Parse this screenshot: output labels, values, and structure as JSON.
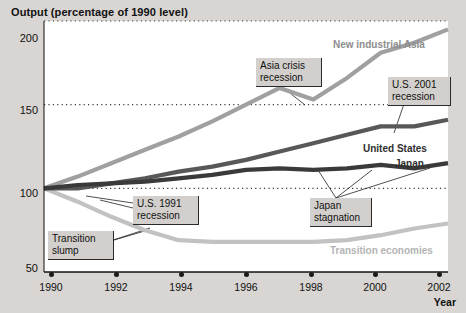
{
  "chart_data": {
    "type": "line",
    "title": "Output (percentage of 1990 level)",
    "xlabel": "Year",
    "ylabel": "",
    "x": [
      1990,
      1991,
      1992,
      1993,
      1994,
      1995,
      1996,
      1997,
      1998,
      1999,
      2000,
      2001,
      2002
    ],
    "xlim": [
      1990,
      2002
    ],
    "ylim": [
      50,
      200
    ],
    "yticks": [
      50,
      100,
      150,
      200
    ],
    "xticks": [
      1990,
      1992,
      1994,
      1996,
      1998,
      2000,
      2002
    ],
    "grid": "horizontal-dotted",
    "legend": "inline-labels",
    "series": [
      {
        "name": "New industrial Asia",
        "color": "#a0a0a0",
        "values": [
          100,
          107,
          115,
          123,
          131,
          140,
          150,
          160,
          153,
          166,
          181,
          187,
          195
        ]
      },
      {
        "name": "United States",
        "color": "#585858",
        "values": [
          100,
          100,
          103,
          106,
          110,
          113,
          117,
          122,
          127,
          132,
          137,
          137,
          141
        ]
      },
      {
        "name": "Japan",
        "color": "#3a3a3a",
        "values": [
          100,
          102,
          103,
          104,
          106,
          108,
          111,
          112,
          111,
          112,
          114,
          112,
          115
        ]
      },
      {
        "name": "Transition economies",
        "color": "#c2c2c2",
        "values": [
          100,
          92,
          83,
          75,
          69,
          68,
          68,
          68,
          68,
          69,
          72,
          76,
          79
        ]
      }
    ],
    "annotations": [
      {
        "id": "transition-slump",
        "text": "Transition\nslump"
      },
      {
        "id": "us-1991-recession",
        "text": "U.S. 1991\nrecession"
      },
      {
        "id": "asia-crisis-recession",
        "text": "Asia crisis\nrecession"
      },
      {
        "id": "us-2001-recession",
        "text": "U.S. 2001\nrecession"
      },
      {
        "id": "japan-stagnation",
        "text": "Japan\nstagnation"
      }
    ]
  },
  "axes": {
    "y_tick_labels": [
      "200",
      "150",
      "100",
      "50"
    ],
    "x_tick_labels": [
      "1990",
      "1992",
      "1994",
      "1996",
      "1998",
      "2000",
      "2002"
    ],
    "x_axis_title": "Year"
  },
  "series_labels": {
    "asia": "New industrial Asia",
    "us": "United States",
    "japan": "Japan",
    "transition": "Transition economies"
  },
  "callouts": {
    "transition_slump": "Transition\nslump",
    "us_1991": "U.S. 1991\nrecession",
    "asia_crisis": "Asia crisis\nrecession",
    "us_2001": "U.S. 2001\nrecession",
    "japan_stagnation": "Japan\nstagnation"
  },
  "colors": {
    "asia": "#a0a0a0",
    "us": "#585858",
    "japan": "#3a3a3a",
    "transition": "#c2c2c2",
    "background": "#d8d5d2",
    "plot": "#ffffff"
  }
}
